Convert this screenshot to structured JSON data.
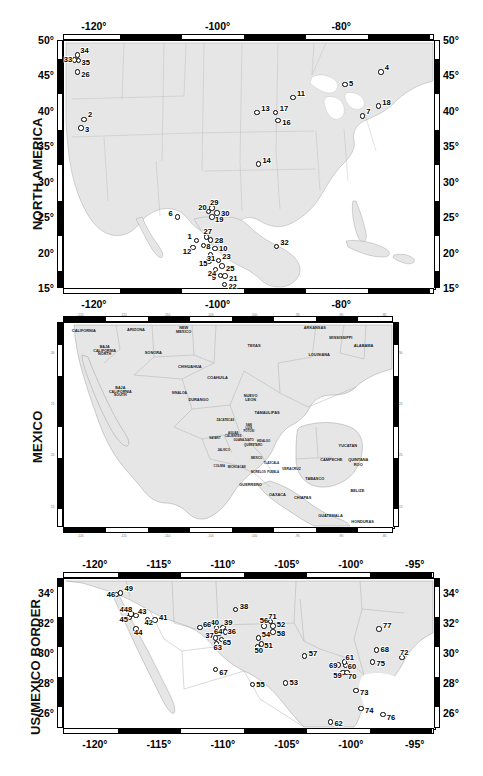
{
  "figure": {
    "width": 483,
    "height": 776,
    "panel_count": 3,
    "marker_style": "open-circle",
    "land_color": "#e9e9e9",
    "ocean_color": "#ffffff",
    "frame_color": "#000000"
  },
  "panels": [
    {
      "id": "north-america",
      "title": "NORTH AMERICA",
      "lon_ticks": [
        "-120°",
        "-100°",
        "-80°"
      ],
      "lon_tick_values": [
        -120,
        -100,
        -80
      ],
      "lat_ticks": [
        "50°",
        "45°",
        "40°",
        "35°",
        "30°",
        "25°",
        "20°",
        "15°"
      ],
      "lat_tick_values": [
        50,
        45,
        40,
        35,
        30,
        25,
        20,
        15
      ],
      "lon_range": [
        -125,
        -65
      ],
      "lat_range": [
        15,
        50
      ],
      "sites": [
        {
          "label": "1",
          "lon": -103.4,
          "lat": 21.7,
          "lx": -9,
          "ly": -4
        },
        {
          "label": "2",
          "lon": -121.6,
          "lat": 38.8,
          "lx": 4,
          "ly": -4
        },
        {
          "label": "3",
          "lon": -122.1,
          "lat": 37.6,
          "lx": 4,
          "ly": 2
        },
        {
          "label": "4",
          "lon": -73.6,
          "lat": 45.5,
          "lx": 4,
          "ly": -4
        },
        {
          "label": "5",
          "lon": -79.4,
          "lat": 43.7,
          "lx": 4,
          "ly": -1
        },
        {
          "label": "6",
          "lon": -106.5,
          "lat": 25.0,
          "lx": -9,
          "ly": -3
        },
        {
          "label": "7",
          "lon": -76.6,
          "lat": 39.3,
          "lx": 4,
          "ly": -4
        },
        {
          "label": "8",
          "lon": -102.3,
          "lat": 21.0,
          "lx": 3,
          "ly": 2
        },
        {
          "label": "9",
          "lon": -99.5,
          "lat": 16.8,
          "lx": -9,
          "ly": 3
        },
        {
          "label": "10",
          "lon": -100.4,
          "lat": 20.6,
          "lx": 4,
          "ly": 1
        },
        {
          "label": "11",
          "lon": -87.8,
          "lat": 41.9,
          "lx": 4,
          "ly": -3
        },
        {
          "label": "12",
          "lon": -104.0,
          "lat": 20.7,
          "lx": -10,
          "ly": 4
        },
        {
          "label": "13",
          "lon": -93.6,
          "lat": 39.8,
          "lx": 4,
          "ly": -3
        },
        {
          "label": "14",
          "lon": -93.4,
          "lat": 32.5,
          "lx": 4,
          "ly": -3
        },
        {
          "label": "15",
          "lon": -101.4,
          "lat": 18.8,
          "lx": -10,
          "ly": 3
        },
        {
          "label": "16",
          "lon": -90.2,
          "lat": 38.6,
          "lx": 4,
          "ly": 2
        },
        {
          "label": "17",
          "lon": -90.6,
          "lat": 39.8,
          "lx": 4,
          "ly": -3
        },
        {
          "label": "18",
          "lon": -74.0,
          "lat": 40.7,
          "lx": 4,
          "ly": -3
        },
        {
          "label": "19",
          "lon": -100.9,
          "lat": 25.0,
          "lx": 3,
          "ly": 3
        },
        {
          "label": "20",
          "lon": -101.5,
          "lat": 25.8,
          "lx": -10,
          "ly": -3
        },
        {
          "label": "21",
          "lon": -98.8,
          "lat": 16.7,
          "lx": 4,
          "ly": 3
        },
        {
          "label": "22",
          "lon": -98.9,
          "lat": 15.5,
          "lx": 4,
          "ly": 3
        },
        {
          "label": "23",
          "lon": -99.9,
          "lat": 18.9,
          "lx": 4,
          "ly": -3
        },
        {
          "label": "24",
          "lon": -100.3,
          "lat": 17.6,
          "lx": -8,
          "ly": 4
        },
        {
          "label": "25",
          "lon": -99.3,
          "lat": 18.1,
          "lx": 4,
          "ly": 3
        },
        {
          "label": "26",
          "lon": -122.7,
          "lat": 45.5,
          "lx": 4,
          "ly": 3
        },
        {
          "label": "27",
          "lon": -101.8,
          "lat": 22.2,
          "lx": -3,
          "ly": -5
        },
        {
          "label": "28",
          "lon": -101.1,
          "lat": 21.8,
          "lx": 4,
          "ly": 1
        },
        {
          "label": "29",
          "lon": -100.9,
          "lat": 26.3,
          "lx": -2,
          "ly": -5
        },
        {
          "label": "30",
          "lon": -100.1,
          "lat": 25.6,
          "lx": 4,
          "ly": 1
        },
        {
          "label": "31",
          "lon": -101.1,
          "lat": 19.7,
          "lx": -4,
          "ly": 4
        },
        {
          "label": "32",
          "lon": -90.5,
          "lat": 20.9,
          "lx": 4,
          "ly": -3
        },
        {
          "label": "33",
          "lon": -123.1,
          "lat": 47.2,
          "lx": -11,
          "ly": 0
        },
        {
          "label": "34",
          "lon": -122.7,
          "lat": 47.9,
          "lx": 3,
          "ly": -4
        },
        {
          "label": "35",
          "lon": -122.5,
          "lat": 47.1,
          "lx": 3,
          "ly": 2
        }
      ]
    },
    {
      "id": "mexico",
      "title": "MEXICO",
      "lon_ticks": [
        "-120",
        "-115",
        "-110",
        "-105",
        "-100",
        "-95",
        "-90",
        "-85"
      ],
      "lon_tick_values": [
        -120,
        -115,
        -110,
        -105,
        -100,
        -95,
        -90,
        -85
      ],
      "lat_ticks": [
        "30",
        "25",
        "20",
        "15"
      ],
      "lat_tick_values": [
        30,
        25,
        20,
        15
      ],
      "lon_range": [
        -122,
        -84
      ],
      "lat_range": [
        13,
        33
      ],
      "regions": [
        {
          "name": "CALIFORNIA",
          "lon": -119.6,
          "lat": 32.1,
          "size": 3.9
        },
        {
          "name": "ARIZONA",
          "lon": -113.6,
          "lat": 32.2,
          "size": 3.9
        },
        {
          "name": "NEW MEXICO",
          "lon": -108.1,
          "lat": 32.2,
          "size": 3.9
        },
        {
          "name": "TEXAS",
          "lon": -100.0,
          "lat": 30.7,
          "size": 3.9
        },
        {
          "name": "ARKANSAS",
          "lon": -93.0,
          "lat": 32.4,
          "size": 3.9
        },
        {
          "name": "MISSISSIPPI",
          "lon": -90.0,
          "lat": 31.4,
          "size": 3.9
        },
        {
          "name": "ALABAMA",
          "lon": -87.4,
          "lat": 30.7,
          "size": 3.9
        },
        {
          "name": "LOUISIANA",
          "lon": -92.5,
          "lat": 29.8,
          "size": 3.9
        },
        {
          "name": "BAJA\nCALIFORNIA\nNORTH",
          "lon": -117.2,
          "lat": 30.1,
          "size": 3.7
        },
        {
          "name": "BAJA\nCALIFORNIA\nSOUTH",
          "lon": -115.4,
          "lat": 26.1,
          "size": 3.7
        },
        {
          "name": "SONORA",
          "lon": -111.6,
          "lat": 30.0,
          "size": 3.9
        },
        {
          "name": "CHIHUAHUA",
          "lon": -107.4,
          "lat": 28.6,
          "size": 3.9
        },
        {
          "name": "COAHUILA",
          "lon": -104.2,
          "lat": 27.5,
          "size": 3.9
        },
        {
          "name": "DURANGO",
          "lon": -106.4,
          "lat": 25.4,
          "size": 3.9
        },
        {
          "name": "NUEVO\nLEON",
          "lon": -100.4,
          "lat": 25.6,
          "size": 3.9
        },
        {
          "name": "TAMAULIPAS",
          "lon": -98.5,
          "lat": 24.1,
          "size": 3.9
        },
        {
          "name": "SINALOA",
          "lon": -108.6,
          "lat": 26.0,
          "size": 3.4
        },
        {
          "name": "ZACATECAS",
          "lon": -103.3,
          "lat": 23.3,
          "size": 2.9
        },
        {
          "name": "SAN\nLUIS\nPOTOSI",
          "lon": -100.6,
          "lat": 22.6,
          "size": 2.9
        },
        {
          "name": "AGUAS\nCALIENTES",
          "lon": -102.4,
          "lat": 22.0,
          "size": 2.9
        },
        {
          "name": "NAYARIT",
          "lon": -104.5,
          "lat": 21.6,
          "size": 2.7
        },
        {
          "name": "GUANAJUATO",
          "lon": -101.2,
          "lat": 21.4,
          "size": 2.9
        },
        {
          "name": "QUERETARO",
          "lon": -100.1,
          "lat": 20.9,
          "size": 2.9
        },
        {
          "name": "HIDALGO",
          "lon": -98.9,
          "lat": 21.3,
          "size": 2.9
        },
        {
          "name": "JALISCO",
          "lon": -103.5,
          "lat": 20.4,
          "size": 2.9
        },
        {
          "name": "COLIMA",
          "lon": -104.0,
          "lat": 18.9,
          "size": 2.9
        },
        {
          "name": "MICHOACAN",
          "lon": -102.0,
          "lat": 18.8,
          "size": 2.9
        },
        {
          "name": "MEXICO",
          "lon": -99.7,
          "lat": 19.6,
          "size": 2.9
        },
        {
          "name": "TLAXCALA",
          "lon": -98.0,
          "lat": 19.1,
          "size": 2.9
        },
        {
          "name": "MORELOS",
          "lon": -99.5,
          "lat": 18.3,
          "size": 2.9
        },
        {
          "name": "PUEBLA",
          "lon": -97.8,
          "lat": 18.3,
          "size": 2.9
        },
        {
          "name": "GUERRERO",
          "lon": -100.4,
          "lat": 17.1,
          "size": 3.9
        },
        {
          "name": "OAXACA",
          "lon": -97.3,
          "lat": 16.1,
          "size": 3.9
        },
        {
          "name": "VERACRUZ",
          "lon": -95.7,
          "lat": 18.6,
          "size": 3.4
        },
        {
          "name": "TABASCO",
          "lon": -93.0,
          "lat": 17.7,
          "size": 3.9
        },
        {
          "name": "CHIAPAS",
          "lon": -94.4,
          "lat": 15.8,
          "size": 3.9
        },
        {
          "name": "CAMPECHE",
          "lon": -91.1,
          "lat": 19.5,
          "size": 3.9
        },
        {
          "name": "YUCATAN",
          "lon": -89.2,
          "lat": 20.9,
          "size": 3.9
        },
        {
          "name": "QUINTANA\nROO",
          "lon": -88.0,
          "lat": 19.3,
          "size": 3.9
        },
        {
          "name": "BELIZE",
          "lon": -88.1,
          "lat": 16.5,
          "size": 3.9
        },
        {
          "name": "GUATEMALA",
          "lon": -91.2,
          "lat": 14.1,
          "size": 3.9
        },
        {
          "name": "HONDURAS",
          "lon": -87.5,
          "lat": 13.5,
          "size": 3.9
        }
      ]
    },
    {
      "id": "us-mexico-border",
      "title": "US/MEXICO BORDER",
      "lon_ticks": [
        "-120°",
        "-115°",
        "-110°",
        "-105°",
        "-100°",
        "-95°"
      ],
      "lon_tick_values": [
        -120,
        -115,
        -110,
        -105,
        -100,
        -95
      ],
      "lat_ticks": [
        "34°",
        "32°",
        "30°",
        "28°",
        "26°"
      ],
      "lat_tick_values": [
        34,
        32,
        30,
        28,
        26
      ],
      "lon_range": [
        -122.5,
        -93.5
      ],
      "lat_range": [
        25,
        35
      ],
      "sites": [
        {
          "label": "37",
          "lon": -110.6,
          "lat": 31.0,
          "lx": -10,
          "ly": -2
        },
        {
          "label": "38",
          "lon": -109.0,
          "lat": 32.9,
          "lx": 4,
          "ly": -3
        },
        {
          "label": "39",
          "lon": -110.0,
          "lat": 31.7,
          "lx": 1,
          "ly": -5
        },
        {
          "label": "40",
          "lon": -110.5,
          "lat": 31.7,
          "lx": -6,
          "ly": -5
        },
        {
          "label": "41",
          "lon": -115.3,
          "lat": 32.2,
          "lx": 4,
          "ly": -2
        },
        {
          "label": "42",
          "lon": -115.9,
          "lat": 32.2,
          "lx": -3,
          "ly": 3
        },
        {
          "label": "43",
          "lon": -116.8,
          "lat": 32.5,
          "lx": 2,
          "ly": -4
        },
        {
          "label": "44",
          "lon": -116.8,
          "lat": 31.6,
          "lx": -2,
          "ly": 4
        },
        {
          "label": "45",
          "lon": -117.3,
          "lat": 32.4,
          "lx": -10,
          "ly": 3
        },
        {
          "label": "46",
          "lon": -118.3,
          "lat": 33.9,
          "lx": -10,
          "ly": 0
        },
        {
          "label": "47",
          "lon": -117.2,
          "lat": 32.6,
          "lx": -11,
          "ly": -4
        },
        {
          "label": "48",
          "lon": -117.2,
          "lat": 32.6,
          "lx": -7,
          "ly": -4
        },
        {
          "label": "49",
          "lon": -118.0,
          "lat": 34.0,
          "lx": 4,
          "ly": -4
        },
        {
          "label": "50",
          "lon": -107.3,
          "lat": 30.4,
          "lx": -3,
          "ly": 4
        },
        {
          "label": "51",
          "lon": -107.0,
          "lat": 30.6,
          "lx": 3,
          "ly": 2
        },
        {
          "label": "52",
          "lon": -106.1,
          "lat": 31.8,
          "lx": 4,
          "ly": -1
        },
        {
          "label": "53",
          "lon": -105.1,
          "lat": 28.0,
          "lx": 4,
          "ly": 0
        },
        {
          "label": "54",
          "lon": -107.2,
          "lat": 31.0,
          "lx": 3,
          "ly": -3
        },
        {
          "label": "55",
          "lon": -107.7,
          "lat": 27.9,
          "lx": 4,
          "ly": 0
        },
        {
          "label": "56",
          "lon": -106.8,
          "lat": 31.8,
          "lx": -4,
          "ly": -5
        },
        {
          "label": "57",
          "lon": -103.6,
          "lat": 29.8,
          "lx": 4,
          "ly": -2
        },
        {
          "label": "58",
          "lon": -106.1,
          "lat": 31.4,
          "lx": 4,
          "ly": 2
        },
        {
          "label": "59",
          "lon": -100.6,
          "lat": 28.7,
          "lx": -10,
          "ly": 3
        },
        {
          "label": "60",
          "lon": -100.4,
          "lat": 29.2,
          "lx": 2,
          "ly": 2
        },
        {
          "label": "61",
          "lon": -100.5,
          "lat": 29.4,
          "lx": 1,
          "ly": -4
        },
        {
          "label": "62",
          "lon": -101.6,
          "lat": 25.4,
          "lx": 4,
          "ly": 2
        },
        {
          "label": "63",
          "lon": -110.5,
          "lat": 30.6,
          "lx": -3,
          "ly": 4
        },
        {
          "label": "64",
          "lon": -110.3,
          "lat": 31.3,
          "lx": -5,
          "ly": -2
        },
        {
          "label": "65",
          "lon": -110.1,
          "lat": 30.9,
          "lx": 1,
          "ly": 3
        },
        {
          "label": "66",
          "lon": -111.8,
          "lat": 31.7,
          "lx": 3,
          "ly": -3
        },
        {
          "label": "67",
          "lon": -110.6,
          "lat": 28.9,
          "lx": 4,
          "ly": 3
        },
        {
          "label": "68",
          "lon": -98.0,
          "lat": 30.2,
          "lx": 4,
          "ly": 0
        },
        {
          "label": "69",
          "lon": -101.0,
          "lat": 29.2,
          "lx": -9,
          "ly": 1
        },
        {
          "label": "70",
          "lon": -100.3,
          "lat": 28.7,
          "lx": 1,
          "ly": 4
        },
        {
          "label": "71",
          "lon": -106.3,
          "lat": 32.1,
          "lx": -2,
          "ly": -5
        },
        {
          "label": "72",
          "lon": -96.0,
          "lat": 29.7,
          "lx": -2,
          "ly": -5
        },
        {
          "label": "73",
          "lon": -99.6,
          "lat": 27.5,
          "lx": 4,
          "ly": 2
        },
        {
          "label": "74",
          "lon": -99.2,
          "lat": 26.3,
          "lx": 4,
          "ly": 2
        },
        {
          "label": "75",
          "lon": -98.3,
          "lat": 29.4,
          "lx": 4,
          "ly": 2
        },
        {
          "label": "76",
          "lon": -97.5,
          "lat": 25.9,
          "lx": 4,
          "ly": 3
        },
        {
          "label": "77",
          "lon": -97.8,
          "lat": 31.6,
          "lx": 4,
          "ly": -3
        },
        {
          "label": "36",
          "lon": -109.8,
          "lat": 31.4,
          "lx": 2,
          "ly": 0
        }
      ]
    }
  ]
}
